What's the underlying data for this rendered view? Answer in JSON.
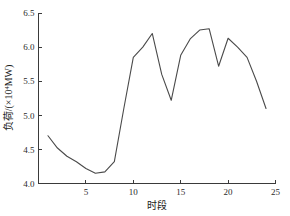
{
  "chart_data": {
    "type": "line",
    "title": "",
    "xlabel": "时段",
    "ylabel": "负荷/(×10⁴MW)",
    "ylabel_parts": {
      "prefix": "负荷/(×10",
      "exponent": "4",
      "suffix": "MW)"
    },
    "x": [
      1,
      2,
      3,
      4,
      5,
      6,
      7,
      8,
      9,
      10,
      11,
      12,
      13,
      14,
      15,
      16,
      17,
      18,
      19,
      20,
      21,
      22,
      23,
      24
    ],
    "values": [
      4.7,
      4.52,
      4.4,
      4.32,
      4.22,
      4.15,
      4.17,
      4.32,
      5.1,
      5.85,
      6.0,
      6.2,
      5.6,
      5.22,
      5.88,
      6.12,
      6.25,
      6.27,
      5.72,
      6.13,
      6.0,
      5.85,
      5.5,
      5.1
    ],
    "series": [
      {
        "name": "负荷",
        "values": [
          4.7,
          4.52,
          4.4,
          4.32,
          4.22,
          4.15,
          4.17,
          4.32,
          5.1,
          5.85,
          6.0,
          6.2,
          5.6,
          5.22,
          5.88,
          6.12,
          6.25,
          6.27,
          5.72,
          6.13,
          6.0,
          5.85,
          5.5,
          5.1
        ]
      }
    ],
    "xlim": [
      0,
      25
    ],
    "ylim": [
      4.0,
      6.5
    ],
    "xticks": [
      5,
      10,
      15,
      20,
      25
    ],
    "xtick_labels": [
      "5",
      "10",
      "15",
      "20",
      "25"
    ],
    "yticks": [
      4.0,
      4.5,
      5.0,
      5.5,
      6.0,
      6.5
    ],
    "ytick_labels": [
      "4.0",
      "4.5",
      "5.0",
      "5.5",
      "6.0",
      "6.5"
    ],
    "grid": false,
    "legend": false,
    "line_color": "#4a4a4a",
    "axis_color": "#3a3a3a",
    "background_color": "#ffffff"
  }
}
